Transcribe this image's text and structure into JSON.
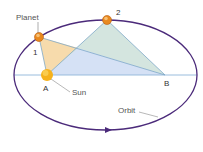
{
  "diagram": {
    "labels": {
      "planet": "Planet",
      "point1": "1",
      "point2": "2",
      "pointA": "A",
      "pointB": "B",
      "sun": "Sun",
      "orbit": "Orbit"
    },
    "colors": {
      "orbit": "#4b2a7a",
      "axis": "#8fb6d9",
      "area_orange": "#f7d9a8",
      "area_teal": "#cfe2dc",
      "area_blue": "#d5e0f5",
      "planet": "#e8891f",
      "sun": "#f6b21c"
    }
  }
}
